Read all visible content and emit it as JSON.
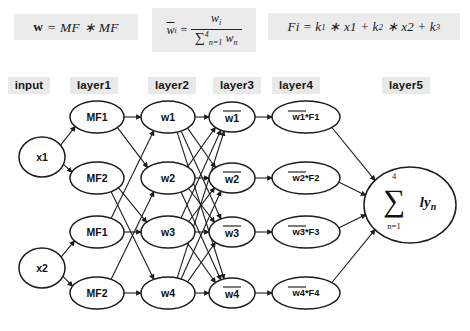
{
  "figure": {
    "kind": "anfis-network-diagram",
    "background": "#ffffff",
    "stroke_color": "#1c1c1c",
    "label_background": "#e9e9e9"
  },
  "formulas": [
    {
      "id": "w",
      "text": "w = MF * MF"
    },
    {
      "id": "wbar",
      "text": "w̄i = wi / Σ n=1..4 wn",
      "lhs": "w",
      "lhs_sub": "i",
      "eq": "=",
      "numerator": "w",
      "numerator_sub": "i",
      "denominator_sum": "∑",
      "denominator_sup": "4",
      "denominator_sub": "n=1",
      "denominator_term": "w",
      "denominator_term_sub": "n"
    },
    {
      "id": "fi",
      "text": "Fi = k1 * x1 + k2 * x2 + k3"
    }
  ],
  "layer_labels": [
    {
      "id": "input",
      "label": "input",
      "x": 8,
      "y": 77,
      "w": 42
    },
    {
      "id": "layer1",
      "label": "layer1",
      "x": 70,
      "y": 77,
      "w": 48
    },
    {
      "id": "layer2",
      "label": "layer2",
      "x": 148,
      "y": 77,
      "w": 48
    },
    {
      "id": "layer3",
      "label": "layer3",
      "x": 213,
      "y": 77,
      "w": 48
    },
    {
      "id": "layer4",
      "label": "layer4",
      "x": 272,
      "y": 77,
      "w": 48
    },
    {
      "id": "layer5",
      "label": "layer5",
      "x": 382,
      "y": 77,
      "w": 48
    }
  ],
  "nodes": {
    "input": [
      {
        "id": "x1",
        "label": "x1",
        "cx": 42,
        "cy": 157,
        "rx": 23,
        "ry": 20
      },
      {
        "id": "x2",
        "label": "x2",
        "cx": 42,
        "cy": 268,
        "rx": 23,
        "ry": 20
      }
    ],
    "layer1": [
      {
        "id": "mf1a",
        "label": "MF1",
        "cx": 97,
        "cy": 117,
        "rx": 27,
        "ry": 16
      },
      {
        "id": "mf2a",
        "label": "MF2",
        "cx": 97,
        "cy": 178,
        "rx": 27,
        "ry": 16
      },
      {
        "id": "mf1b",
        "label": "MF1",
        "cx": 97,
        "cy": 232,
        "rx": 27,
        "ry": 16
      },
      {
        "id": "mf2b",
        "label": "MF2",
        "cx": 97,
        "cy": 293,
        "rx": 27,
        "ry": 16
      }
    ],
    "layer2": [
      {
        "id": "w1",
        "label": "w1",
        "cx": 168,
        "cy": 117,
        "rx": 27,
        "ry": 16
      },
      {
        "id": "w2",
        "label": "w2",
        "cx": 168,
        "cy": 178,
        "rx": 27,
        "ry": 16
      },
      {
        "id": "w3",
        "label": "w3",
        "cx": 168,
        "cy": 232,
        "rx": 27,
        "ry": 16
      },
      {
        "id": "w4",
        "label": "w4",
        "cx": 168,
        "cy": 293,
        "rx": 27,
        "ry": 16
      }
    ],
    "layer3": [
      {
        "id": "wbar1",
        "label": "w1",
        "overline": true,
        "cx": 232,
        "cy": 117,
        "rx": 23,
        "ry": 15
      },
      {
        "id": "wbar2",
        "label": "w2",
        "overline": true,
        "cx": 232,
        "cy": 178,
        "rx": 23,
        "ry": 15
      },
      {
        "id": "wbar3",
        "label": "w3",
        "overline": true,
        "cx": 232,
        "cy": 232,
        "rx": 23,
        "ry": 15
      },
      {
        "id": "wbar4",
        "label": "w4",
        "overline": true,
        "cx": 232,
        "cy": 293,
        "rx": 23,
        "ry": 15
      }
    ],
    "layer4": [
      {
        "id": "wf1",
        "label_bar": "w1",
        "label_rest": "*F1",
        "cx": 306,
        "cy": 117,
        "rx": 34,
        "ry": 16
      },
      {
        "id": "wf2",
        "label_bar": "w2",
        "label_rest": "*F2",
        "cx": 306,
        "cy": 178,
        "rx": 34,
        "ry": 16
      },
      {
        "id": "wf3",
        "label_bar": "w3",
        "label_rest": "*F3",
        "cx": 306,
        "cy": 232,
        "rx": 34,
        "ry": 16
      },
      {
        "id": "wf4",
        "label_bar": "w4",
        "label_rest": "*F4",
        "cx": 306,
        "cy": 293,
        "rx": 34,
        "ry": 16
      }
    ],
    "layer5": [
      {
        "id": "sum",
        "sigma": "∑",
        "upper": "4",
        "lower": "n=1",
        "body": "ly",
        "body_sub": "n",
        "cx": 410,
        "cy": 205,
        "rx": 46,
        "ry": 38
      }
    ]
  },
  "edges": [
    {
      "from": "x1",
      "to": "mf1a"
    },
    {
      "from": "x1",
      "to": "mf2a"
    },
    {
      "from": "x2",
      "to": "mf1b"
    },
    {
      "from": "x2",
      "to": "mf2b"
    },
    {
      "from": "mf1a",
      "to": "w1"
    },
    {
      "from": "mf1a",
      "to": "w2"
    },
    {
      "from": "mf2a",
      "to": "w3"
    },
    {
      "from": "mf2a",
      "to": "w4"
    },
    {
      "from": "mf1b",
      "to": "w1"
    },
    {
      "from": "mf1b",
      "to": "w3"
    },
    {
      "from": "mf2b",
      "to": "w2"
    },
    {
      "from": "mf2b",
      "to": "w4"
    },
    {
      "from": "w1",
      "to": "wbar1"
    },
    {
      "from": "w1",
      "to": "wbar2"
    },
    {
      "from": "w1",
      "to": "wbar3"
    },
    {
      "from": "w1",
      "to": "wbar4"
    },
    {
      "from": "w2",
      "to": "wbar1"
    },
    {
      "from": "w2",
      "to": "wbar2"
    },
    {
      "from": "w2",
      "to": "wbar3"
    },
    {
      "from": "w2",
      "to": "wbar4"
    },
    {
      "from": "w3",
      "to": "wbar1"
    },
    {
      "from": "w3",
      "to": "wbar2"
    },
    {
      "from": "w3",
      "to": "wbar3"
    },
    {
      "from": "w3",
      "to": "wbar4"
    },
    {
      "from": "w4",
      "to": "wbar1"
    },
    {
      "from": "w4",
      "to": "wbar2"
    },
    {
      "from": "w4",
      "to": "wbar3"
    },
    {
      "from": "w4",
      "to": "wbar4"
    },
    {
      "from": "wbar1",
      "to": "wf1"
    },
    {
      "from": "wbar2",
      "to": "wf2"
    },
    {
      "from": "wbar3",
      "to": "wf3"
    },
    {
      "from": "wbar4",
      "to": "wf4"
    },
    {
      "from": "wf1",
      "to": "sum"
    },
    {
      "from": "wf2",
      "to": "sum"
    },
    {
      "from": "wf3",
      "to": "sum"
    },
    {
      "from": "wf4",
      "to": "sum"
    }
  ]
}
